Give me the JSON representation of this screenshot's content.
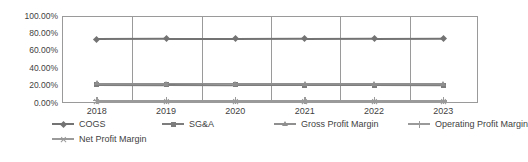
{
  "chart_data": {
    "type": "line",
    "title": "",
    "xlabel": "",
    "ylabel": "",
    "categories": [
      "2018",
      "2019",
      "2020",
      "2021",
      "2022",
      "2023"
    ],
    "ylim": [
      0,
      1.0
    ],
    "ytick_labels": [
      "100.00%",
      "80.00%",
      "60.00%",
      "40.00%",
      "20.00%",
      "0.00%"
    ],
    "ytick_values": [
      1.0,
      0.8,
      0.6,
      0.4,
      0.2,
      0.0
    ],
    "grid": "vertical",
    "legend_position": "bottom",
    "series": [
      {
        "name": "COGS",
        "marker": "diamond",
        "color": "#737373",
        "values": [
          0.735,
          0.737,
          0.736,
          0.738,
          0.74,
          0.742
        ]
      },
      {
        "name": "SG&A",
        "marker": "square",
        "color": "#7d7d7d",
        "values": [
          0.213,
          0.209,
          0.207,
          0.206,
          0.205,
          0.203
        ]
      },
      {
        "name": "Gross Profit Margin",
        "marker": "triangle",
        "color": "#8f8f8f",
        "values": [
          0.225,
          0.224,
          0.224,
          0.223,
          0.222,
          0.221
        ]
      },
      {
        "name": "Operating Profit Margin",
        "marker": "cross",
        "color": "#9a9a9a",
        "values": [
          0.03,
          0.029,
          0.028,
          0.028,
          0.027,
          0.026
        ]
      },
      {
        "name": "Net Profit Margin",
        "marker": "asterisk",
        "color": "#9a9a9a",
        "values": [
          0.021,
          0.02,
          0.02,
          0.019,
          0.019,
          0.018
        ]
      }
    ]
  },
  "legend": {
    "row1": [
      "COGS",
      "SG&A",
      "Gross Profit Margin",
      "Operating Profit Margin"
    ],
    "row2": [
      "Net Profit Margin"
    ]
  }
}
